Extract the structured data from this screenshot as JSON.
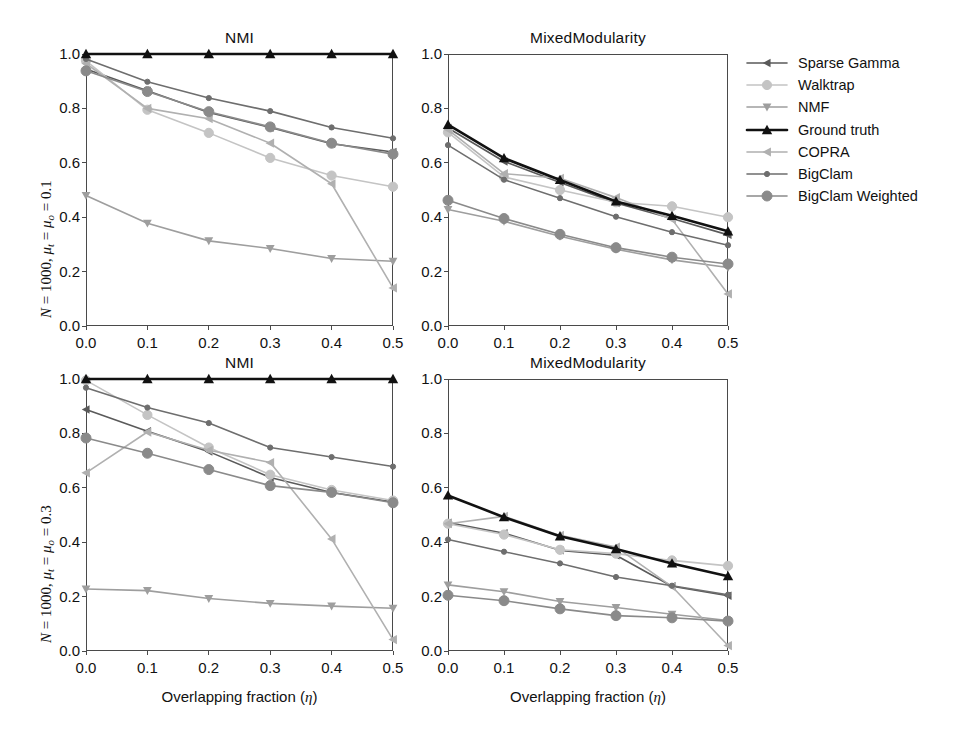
{
  "figure": {
    "width": 959,
    "height": 734,
    "background": "#ffffff"
  },
  "legend": {
    "position": "right",
    "entries": [
      {
        "label": "Sparse Gamma",
        "color": "#5a5a5a",
        "marker": "triangle-left",
        "marker_size": 4.2,
        "linewidth": 1.6
      },
      {
        "label": "Walktrap",
        "color": "#c4c4c4",
        "marker": "circle",
        "marker_size": 4.6,
        "linewidth": 1.6
      },
      {
        "label": "NMF",
        "color": "#9e9e9e",
        "marker": "triangle-down",
        "marker_size": 4.4,
        "linewidth": 1.6
      },
      {
        "label": "Ground truth",
        "color": "#111111",
        "marker": "triangle-up",
        "marker_size": 5.2,
        "linewidth": 2.6
      },
      {
        "label": "COPRA",
        "color": "#b0b0b0",
        "marker": "triangle-left",
        "marker_size": 4.6,
        "linewidth": 1.6
      },
      {
        "label": "BigClam",
        "color": "#6e6e6e",
        "marker": "dot",
        "marker_size": 2.6,
        "linewidth": 1.6
      },
      {
        "label": "BigClam Weighted",
        "color": "#8a8a8a",
        "marker": "circle",
        "marker_size": 5.0,
        "linewidth": 1.6
      }
    ]
  },
  "axes": {
    "x_ticks": [
      "0.0",
      "0.1",
      "0.2",
      "0.3",
      "0.4",
      "0.5"
    ],
    "y_ticks": [
      "0.0",
      "0.2",
      "0.4",
      "0.6",
      "0.8",
      "1.0"
    ],
    "xlim": [
      0.0,
      0.5
    ],
    "ylim": [
      0.0,
      1.0
    ],
    "xlabel": "Overlapping fraction (η)",
    "grid": false
  },
  "row_labels": {
    "top": {
      "prefix": "N",
      "text": " = 1000, ",
      "mu_t": "μ",
      "sub_t": "t",
      "mid": " = ",
      "mu_o": "μ",
      "sub_o": "o",
      "suffix": " = 0.1"
    },
    "bottom": {
      "prefix": "N",
      "text": " = 1000, ",
      "mu_t": "μ",
      "sub_t": "t",
      "mid": " = ",
      "mu_o": "μ",
      "sub_o": "o",
      "suffix": " = 0.3"
    }
  },
  "chart_data": [
    {
      "id": "nmi-top",
      "type": "line",
      "title": "NMI",
      "row": "N = 1000, μ_t = μ_o = 0.1",
      "xlabel": "",
      "ylabel": "NMI",
      "xlim": [
        0.0,
        0.5
      ],
      "ylim": [
        0.0,
        1.0
      ],
      "x": [
        0.0,
        0.1,
        0.2,
        0.3,
        0.4,
        0.5
      ],
      "grid": false,
      "series": [
        {
          "name": "Sparse Gamma",
          "values": [
            0.945,
            0.865,
            0.785,
            0.73,
            0.67,
            0.64
          ]
        },
        {
          "name": "Walktrap",
          "values": [
            0.975,
            0.795,
            0.71,
            0.618,
            0.553,
            0.512
          ]
        },
        {
          "name": "NMF",
          "values": [
            0.48,
            0.378,
            0.313,
            0.285,
            0.248,
            0.238
          ]
        },
        {
          "name": "Ground truth",
          "values": [
            1.0,
            1.0,
            1.0,
            1.0,
            1.0,
            1.0
          ]
        },
        {
          "name": "COPRA",
          "values": [
            0.965,
            0.8,
            0.762,
            0.672,
            0.523,
            0.14
          ]
        },
        {
          "name": "BigClam",
          "values": [
            0.982,
            0.898,
            0.838,
            0.79,
            0.73,
            0.69
          ]
        },
        {
          "name": "BigClam Weighted",
          "values": [
            0.938,
            0.862,
            0.788,
            0.732,
            0.672,
            0.632
          ]
        }
      ]
    },
    {
      "id": "mixedmod-top",
      "type": "line",
      "title": "MixedModularity",
      "row": "N = 1000, μ_t = μ_o = 0.1",
      "xlabel": "",
      "ylabel": "MixedModularity",
      "xlim": [
        0.0,
        0.5
      ],
      "ylim": [
        0.0,
        1.0
      ],
      "x": [
        0.0,
        0.1,
        0.2,
        0.3,
        0.4,
        0.5
      ],
      "grid": false,
      "series": [
        {
          "name": "Sparse Gamma",
          "values": [
            0.728,
            0.605,
            0.528,
            0.452,
            0.395,
            0.335
          ]
        },
        {
          "name": "Walktrap",
          "values": [
            0.712,
            0.548,
            0.5,
            0.455,
            0.44,
            0.4
          ]
        },
        {
          "name": "NMF",
          "values": [
            0.428,
            0.385,
            0.33,
            0.282,
            0.243,
            0.215
          ]
        },
        {
          "name": "Ground truth",
          "values": [
            0.74,
            0.617,
            0.537,
            0.458,
            0.405,
            0.348
          ]
        },
        {
          "name": "COPRA",
          "values": [
            0.722,
            0.56,
            0.543,
            0.472,
            0.392,
            0.118
          ]
        },
        {
          "name": "BigClam",
          "values": [
            0.665,
            0.538,
            0.47,
            0.402,
            0.345,
            0.297
          ]
        },
        {
          "name": "BigClam Weighted",
          "values": [
            0.462,
            0.395,
            0.337,
            0.288,
            0.253,
            0.228
          ]
        }
      ]
    },
    {
      "id": "nmi-bottom",
      "type": "line",
      "title": "NMI",
      "row": "N = 1000, μ_t = μ_o = 0.3",
      "xlabel": "Overlapping fraction (η)",
      "ylabel": "NMI",
      "xlim": [
        0.0,
        0.5
      ],
      "ylim": [
        0.0,
        1.0
      ],
      "x": [
        0.0,
        0.1,
        0.2,
        0.3,
        0.4,
        0.5
      ],
      "grid": false,
      "series": [
        {
          "name": "Sparse Gamma",
          "values": [
            0.888,
            0.808,
            0.733,
            0.638,
            0.583,
            0.548
          ]
        },
        {
          "name": "Walktrap",
          "values": [
            0.995,
            0.868,
            0.748,
            0.648,
            0.592,
            0.553
          ]
        },
        {
          "name": "NMF",
          "values": [
            0.228,
            0.222,
            0.193,
            0.175,
            0.165,
            0.157
          ]
        },
        {
          "name": "Ground truth",
          "values": [
            1.0,
            1.0,
            1.0,
            1.0,
            1.0,
            1.0
          ]
        },
        {
          "name": "COPRA",
          "values": [
            0.655,
            0.805,
            0.738,
            0.693,
            0.412,
            0.042
          ]
        },
        {
          "name": "BigClam",
          "values": [
            0.968,
            0.895,
            0.838,
            0.748,
            0.713,
            0.678
          ]
        },
        {
          "name": "BigClam Weighted",
          "values": [
            0.783,
            0.727,
            0.667,
            0.608,
            0.583,
            0.545
          ]
        }
      ]
    },
    {
      "id": "mixedmod-bottom",
      "type": "line",
      "title": "MixedModularity",
      "row": "N = 1000, μ_t = μ_o = 0.3",
      "xlabel": "Overlapping fraction (η)",
      "ylabel": "MixedModularity",
      "xlim": [
        0.0,
        0.5
      ],
      "ylim": [
        0.0,
        1.0
      ],
      "x": [
        0.0,
        0.1,
        0.2,
        0.3,
        0.4,
        0.5
      ],
      "grid": false,
      "series": [
        {
          "name": "Sparse Gamma",
          "values": [
            0.472,
            0.433,
            0.37,
            0.352,
            0.238,
            0.203
          ]
        },
        {
          "name": "Walktrap",
          "values": [
            0.468,
            0.428,
            0.372,
            0.358,
            0.333,
            0.313
          ]
        },
        {
          "name": "NMF",
          "values": [
            0.243,
            0.218,
            0.182,
            0.16,
            0.135,
            0.112
          ]
        },
        {
          "name": "Ground truth",
          "values": [
            0.572,
            0.492,
            0.422,
            0.375,
            0.322,
            0.275
          ]
        },
        {
          "name": "COPRA",
          "values": [
            0.468,
            0.495,
            0.425,
            0.382,
            0.237,
            0.02
          ]
        },
        {
          "name": "BigClam",
          "values": [
            0.41,
            0.365,
            0.322,
            0.272,
            0.24,
            0.207
          ]
        },
        {
          "name": "BigClam Weighted",
          "values": [
            0.205,
            0.185,
            0.155,
            0.13,
            0.122,
            0.11
          ]
        }
      ]
    }
  ]
}
